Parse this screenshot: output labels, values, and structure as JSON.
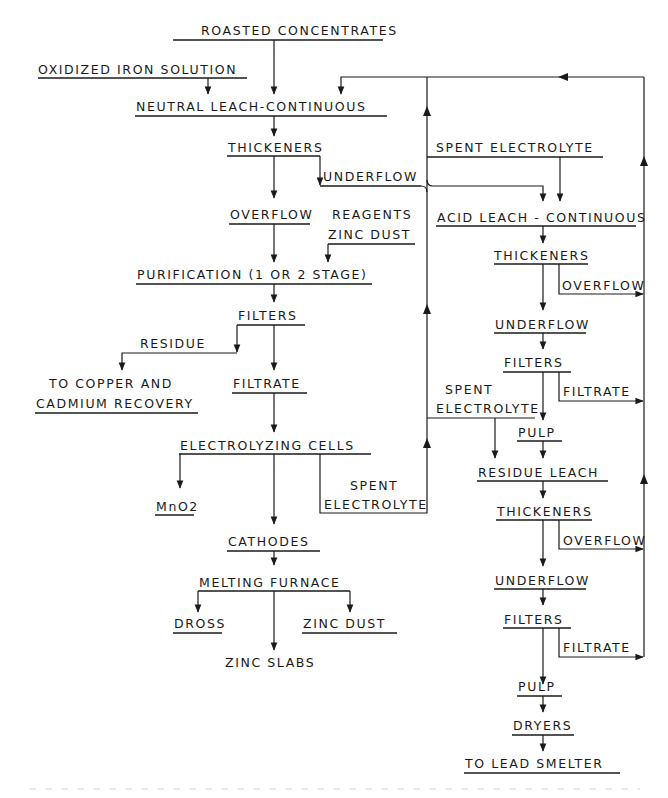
{
  "diagram": {
    "type": "process-flowchart",
    "nodes": {
      "roasted_concentrates": "ROASTED CONCENTRATES",
      "oxidized_iron_solution": "OXIDIZED IRON SOLUTION",
      "neutral_leach": "NEUTRAL LEACH-CONTINUOUS",
      "thickeners_1": "THICKENERS",
      "underflow_1": "UNDERFLOW",
      "spent_electrolyte_top": "SPENT ELECTROLYTE",
      "overflow_1": "OVERFLOW",
      "reagents": "REAGENTS",
      "zinc_dust_reagent": "ZINC DUST",
      "acid_leach": "ACID LEACH - CONTINUOUS",
      "purification": "PURIFICATION (1 OR 2 STAGE)",
      "thickeners_2": "THICKENERS",
      "overflow_2": "OVERFLOW",
      "filters_1": "FILTERS",
      "underflow_2": "UNDERFLOW",
      "residue": "RESIDUE",
      "filters_2": "FILTERS",
      "to_copper_line1": "TO COPPER AND",
      "to_copper_line2": "CADMIUM RECOVERY",
      "filtrate_1": "FILTRATE",
      "spent_mid_line1": "SPENT",
      "spent_mid_line2": "ELECTROLYTE",
      "filtrate_2": "FILTRATE",
      "pulp_1": "PULP",
      "electrolyzing_cells": "ELECTROLYZING CELLS",
      "residue_leach": "RESIDUE LEACH",
      "mno2": "MnO2",
      "spent_low_line1": "SPENT",
      "spent_low_line2": "ELECTROLYTE",
      "thickeners_3": "THICKENERS",
      "overflow_3": "OVERFLOW",
      "cathodes": "CATHODES",
      "underflow_3": "UNDERFLOW",
      "melting_furnace": "MELTING FURNACE",
      "filters_3": "FILTERS",
      "dross": "DROSS",
      "zinc_dust_product": "ZINC DUST",
      "filtrate_3": "FILTRATE",
      "zinc_slabs": "ZINC SLABS",
      "pulp_2": "PULP",
      "dryers": "DRYERS",
      "to_lead_smelter": "TO LEAD SMELTER"
    },
    "edges": [
      {
        "from": "ROASTED CONCENTRATES",
        "to": "NEUTRAL LEACH-CONTINUOUS"
      },
      {
        "from": "OXIDIZED IRON SOLUTION",
        "to": "NEUTRAL LEACH-CONTINUOUS"
      },
      {
        "from": "NEUTRAL LEACH-CONTINUOUS",
        "to": "THICKENERS"
      },
      {
        "from": "THICKENERS",
        "to": "UNDERFLOW"
      },
      {
        "from": "UNDERFLOW",
        "to": "ACID LEACH - CONTINUOUS"
      },
      {
        "from": "THICKENERS",
        "to": "OVERFLOW"
      },
      {
        "from": "OVERFLOW",
        "to": "PURIFICATION (1 OR 2 STAGE)"
      },
      {
        "from": "REAGENTS / ZINC DUST",
        "to": "PURIFICATION (1 OR 2 STAGE)"
      },
      {
        "from": "PURIFICATION (1 OR 2 STAGE)",
        "to": "FILTERS"
      },
      {
        "from": "FILTERS",
        "to": "RESIDUE"
      },
      {
        "from": "RESIDUE",
        "to": "TO COPPER AND CADMIUM RECOVERY"
      },
      {
        "from": "FILTERS",
        "to": "FILTRATE"
      },
      {
        "from": "FILTRATE",
        "to": "ELECTROLYZING CELLS"
      },
      {
        "from": "ELECTROLYZING CELLS",
        "to": "MnO2"
      },
      {
        "from": "ELECTROLYZING CELLS",
        "to": "CATHODES"
      },
      {
        "from": "ELECTROLYZING CELLS",
        "to": "SPENT ELECTROLYTE (return)"
      },
      {
        "from": "SPENT ELECTROLYTE (return)",
        "to": "NEUTRAL LEACH-CONTINUOUS"
      },
      {
        "from": "SPENT ELECTROLYTE",
        "to": "ACID LEACH - CONTINUOUS"
      },
      {
        "from": "SPENT ELECTROLYTE",
        "to": "RESIDUE LEACH"
      },
      {
        "from": "CATHODES",
        "to": "MELTING FURNACE"
      },
      {
        "from": "MELTING FURNACE",
        "to": "DROSS"
      },
      {
        "from": "MELTING FURNACE",
        "to": "ZINC SLABS"
      },
      {
        "from": "MELTING FURNACE",
        "to": "ZINC DUST"
      },
      {
        "from": "ACID LEACH - CONTINUOUS",
        "to": "THICKENERS"
      },
      {
        "from": "THICKENERS",
        "to": "OVERFLOW (return)"
      },
      {
        "from": "THICKENERS",
        "to": "UNDERFLOW"
      },
      {
        "from": "UNDERFLOW",
        "to": "FILTERS"
      },
      {
        "from": "FILTERS",
        "to": "FILTRATE (return)"
      },
      {
        "from": "FILTERS",
        "to": "PULP"
      },
      {
        "from": "PULP",
        "to": "RESIDUE LEACH"
      },
      {
        "from": "RESIDUE LEACH",
        "to": "THICKENERS"
      },
      {
        "from": "THICKENERS",
        "to": "OVERFLOW (return)"
      },
      {
        "from": "THICKENERS",
        "to": "UNDERFLOW"
      },
      {
        "from": "UNDERFLOW",
        "to": "FILTERS"
      },
      {
        "from": "FILTERS",
        "to": "FILTRATE (return)"
      },
      {
        "from": "FILTERS",
        "to": "PULP"
      },
      {
        "from": "PULP",
        "to": "DRYERS"
      },
      {
        "from": "DRYERS",
        "to": "TO LEAD SMELTER"
      },
      {
        "from": "OVERFLOW/FILTRATE returns",
        "to": "NEUTRAL LEACH-CONTINUOUS"
      }
    ]
  }
}
